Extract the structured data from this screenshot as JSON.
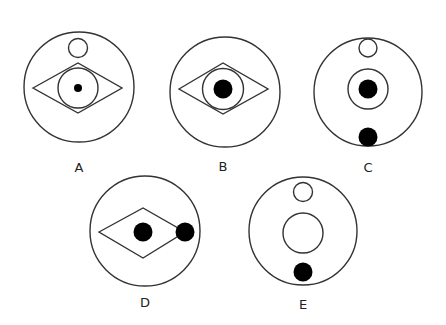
{
  "figures": [
    {
      "label": "A",
      "description": "outer circle with small open circle at top; diamond around an inner circle containing a small black dot"
    },
    {
      "label": "B",
      "description": "outer circle; diamond around an inner circle containing a large black dot"
    },
    {
      "label": "C",
      "description": "outer circle with small open circle at top; inner circle with large black dot; black dot at bottom"
    },
    {
      "label": "D",
      "description": "outer circle; diamond with black dot at center and black dot at right vertex"
    },
    {
      "label": "E",
      "description": "outer circle with small open circle at top; open inner circle; black dot at bottom"
    }
  ],
  "colors": {
    "stroke": "#333333",
    "fill": "#000000",
    "background": "#ffffff"
  }
}
